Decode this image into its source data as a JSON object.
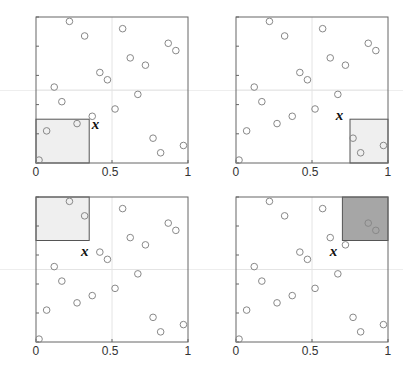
{
  "figure": {
    "axis": {
      "xticks": [
        "0",
        "0.5",
        "1"
      ],
      "yticks": [
        "0",
        "0.2",
        "0.4",
        "0.6",
        "0.8",
        "1"
      ],
      "xlim": [
        0,
        1
      ],
      "ylim": [
        0,
        1
      ],
      "gridlines": [
        0.5
      ]
    },
    "point_label": "x",
    "colors": {
      "marker_edge": "#888888",
      "light_region": "#efefef",
      "dark_region": "#a6a6a6",
      "region_edge": "#555555",
      "gridline": "#e4e4e4"
    }
  },
  "chart_data": {
    "type": "scatter",
    "title": "",
    "xlabel": "",
    "ylabel": "",
    "xlim": [
      0,
      1
    ],
    "ylim": [
      0,
      1
    ],
    "grid": "center lines at 0.5",
    "points": [
      [
        0.02,
        0.02
      ],
      [
        0.07,
        0.22
      ],
      [
        0.12,
        0.52
      ],
      [
        0.17,
        0.42
      ],
      [
        0.22,
        0.97
      ],
      [
        0.27,
        0.27
      ],
      [
        0.32,
        0.87
      ],
      [
        0.37,
        0.32
      ],
      [
        0.42,
        0.62
      ],
      [
        0.47,
        0.57
      ],
      [
        0.52,
        0.37
      ],
      [
        0.57,
        0.92
      ],
      [
        0.62,
        0.72
      ],
      [
        0.67,
        0.47
      ],
      [
        0.72,
        0.67
      ],
      [
        0.77,
        0.17
      ],
      [
        0.82,
        0.07
      ],
      [
        0.87,
        0.82
      ],
      [
        0.92,
        0.77
      ],
      [
        0.97,
        0.12
      ]
    ],
    "panels": [
      {
        "id": "top-left",
        "region": {
          "x0": 0,
          "x1": 0.35,
          "y0": 0,
          "y1": 0.3
        },
        "shade": "light",
        "label": "x",
        "label_pos": [
          0.38,
          0.3
        ]
      },
      {
        "id": "top-right",
        "region": {
          "x0": 0.75,
          "x1": 1,
          "y0": 0,
          "y1": 0.3
        },
        "shade": "light",
        "label": "x",
        "label_pos": [
          0.67,
          0.36
        ]
      },
      {
        "id": "bottom-left",
        "region": {
          "x0": 0,
          "x1": 0.35,
          "y0": 0.7,
          "y1": 1
        },
        "shade": "light",
        "label": "x",
        "label_pos": [
          0.31,
          0.66
        ]
      },
      {
        "id": "bottom-right",
        "region": {
          "x0": 0.7,
          "x1": 1,
          "y0": 0.7,
          "y1": 1
        },
        "shade": "dark",
        "label": "x",
        "label_pos": [
          0.63,
          0.66
        ]
      }
    ]
  }
}
